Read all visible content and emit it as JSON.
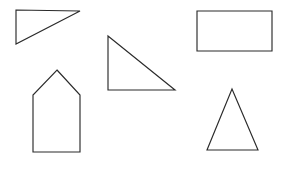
{
  "canvas": {
    "width": 289,
    "height": 178,
    "background_color": "#ffffff",
    "stroke_color": "#2b2b2b",
    "stroke_width": 1.15,
    "fill": "none",
    "description": "Line drawing of five unfilled geometric outline shapes scattered on a plain white field"
  },
  "shapes": [
    {
      "id": "right-triangle-top-left",
      "name": "Right triangle",
      "kind": "triangle",
      "subtype": "right",
      "right_angle_at": "top-left",
      "orientation": "hypotenuse descends left-to-right from upper-right vertex to lower-left vertex",
      "points": "16,10 80,11 16,44",
      "vertices": [
        [
          16,
          10
        ],
        [
          80,
          11
        ],
        [
          16,
          44
        ]
      ],
      "bbox": [
        16,
        10,
        64,
        34
      ]
    },
    {
      "id": "right-triangle-middle",
      "name": "Right triangle",
      "kind": "triangle",
      "subtype": "right",
      "right_angle_at": "bottom-left",
      "orientation": "hypotenuse descends from top-left vertex to bottom-right vertex",
      "points": "108,36 175,90 108,90",
      "vertices": [
        [
          108,
          36
        ],
        [
          175,
          90
        ],
        [
          108,
          90
        ]
      ],
      "bbox": [
        108,
        36,
        67,
        54
      ]
    },
    {
      "id": "rectangle-top-right",
      "name": "Rectangle",
      "kind": "rectangle",
      "subtype": "axis-aligned",
      "orientation": "landscape, wider than tall",
      "points": "197,11 272,11 272,51 197,51",
      "vertices": [
        [
          197,
          11
        ],
        [
          272,
          11
        ],
        [
          272,
          51
        ],
        [
          197,
          51
        ]
      ],
      "bbox": [
        197,
        11,
        75,
        40
      ]
    },
    {
      "id": "pentagon-house-bottom-left",
      "name": "House pentagon",
      "kind": "pentagon",
      "subtype": "house",
      "orientation": "upright, peaked roof on top of a vertical-sided body",
      "points": "57,70 80,95 80,152 33,152 33,95",
      "vertices": [
        [
          57,
          70
        ],
        [
          80,
          95
        ],
        [
          80,
          152
        ],
        [
          33,
          152
        ],
        [
          33,
          95
        ]
      ],
      "bbox": [
        33,
        70,
        47,
        82
      ]
    },
    {
      "id": "triangle-bottom-right",
      "name": "Isosceles triangle",
      "kind": "triangle",
      "subtype": "isosceles",
      "orientation": "apex pointing up, horizontal base",
      "points": "232,89 258,150 207,150",
      "vertices": [
        [
          232,
          89
        ],
        [
          258,
          150
        ],
        [
          207,
          150
        ]
      ],
      "bbox": [
        207,
        89,
        51,
        61
      ]
    }
  ]
}
